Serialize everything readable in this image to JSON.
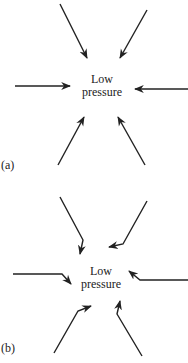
{
  "panels": [
    {
      "id": "a",
      "tag": "(a)",
      "center_label": [
        "Low",
        "pressure"
      ],
      "description": "Winds flow directly inward toward low pressure"
    },
    {
      "id": "b",
      "tag": "(b)",
      "center_label": [
        "Low",
        "pressure"
      ],
      "description": "Winds deflected as they converge toward low pressure"
    }
  ],
  "colors": {
    "ink": "#222222",
    "background": "#ffffff"
  }
}
